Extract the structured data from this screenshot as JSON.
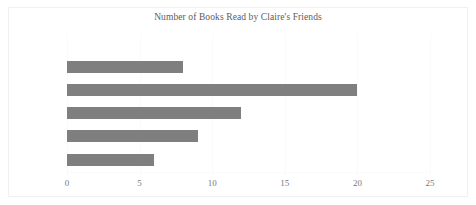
{
  "chart_data": {
    "type": "bar",
    "orientation": "horizontal",
    "title": "Number of Books Read by Claire's Friends",
    "xlabel": "",
    "ylabel": "",
    "categories": [
      "Donald",
      "Lewis",
      "Hillary",
      "Olivia",
      "Anika",
      "Siobhan"
    ],
    "values": [
      0,
      8,
      20,
      12,
      9,
      6
    ],
    "xlim": [
      0,
      25
    ],
    "xticks": [
      "0",
      "5",
      "10",
      "15",
      "20",
      "25"
    ],
    "xtick_values": [
      0,
      5,
      10,
      15,
      20,
      25
    ],
    "grid": true,
    "grid_axis": "x",
    "legend": false,
    "bar_color": "#7f7f7f",
    "text_color": "#5c5c5c",
    "background": "#ffffff"
  }
}
